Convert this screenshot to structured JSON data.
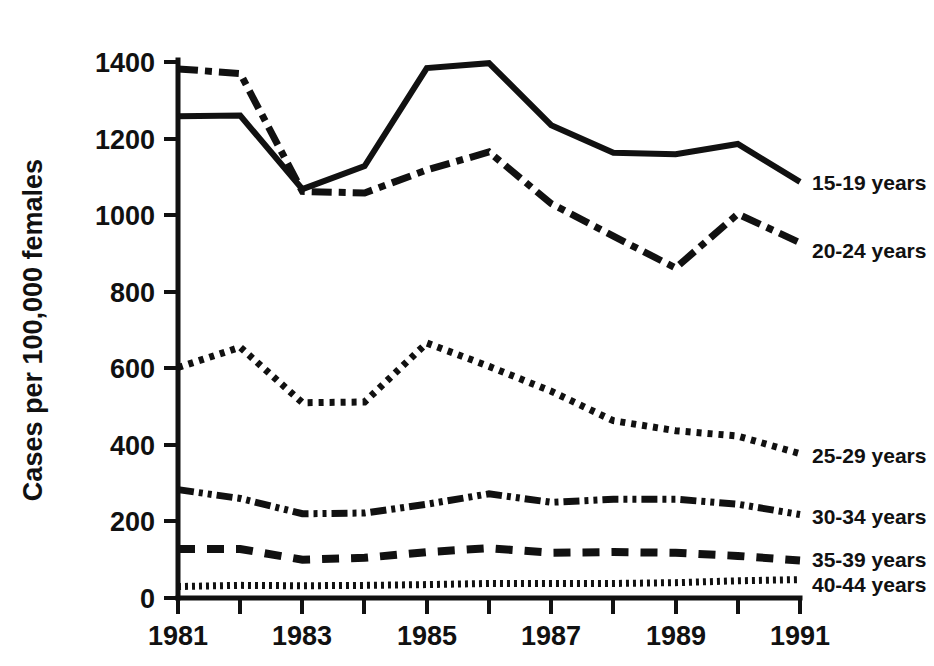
{
  "chart_data": {
    "type": "line",
    "title": "",
    "xlabel": "",
    "ylabel": "Cases per 100,000 females",
    "x": [
      1981,
      1982,
      1983,
      1984,
      1985,
      1986,
      1987,
      1988,
      1989,
      1990,
      1991
    ],
    "xlim": [
      1981,
      1991
    ],
    "ylim": [
      0,
      1400
    ],
    "yticks": [
      0,
      200,
      400,
      600,
      800,
      1000,
      1200,
      1400
    ],
    "ytick_labels": [
      "0",
      "200",
      "400",
      "600",
      "800",
      "1000",
      "1200",
      "1400"
    ],
    "xticks": [
      1981,
      1982,
      1983,
      1984,
      1985,
      1986,
      1987,
      1988,
      1989,
      1990,
      1991
    ],
    "xtick_labels": [
      "1981",
      "",
      "1983",
      "",
      "1985",
      "",
      "1987",
      "",
      "1989",
      "",
      "1991"
    ],
    "xtick_labels_shown": [
      "1981",
      "1983",
      "1985",
      "1987",
      "1989",
      "1991"
    ],
    "grid": false,
    "legend_position": "right-inline",
    "series": [
      {
        "name": "15-19 years",
        "label": "15-19 years",
        "style": "solid",
        "values": [
          1258,
          1260,
          1068,
          1128,
          1384,
          1397,
          1235,
          1163,
          1159,
          1186,
          1087
        ]
      },
      {
        "name": "20-24 years",
        "label": "20-24 years",
        "style": "dash-dot",
        "values": [
          1382,
          1370,
          1062,
          1058,
          1118,
          1165,
          1030,
          945,
          862,
          1003,
          928
        ]
      },
      {
        "name": "25-29 years",
        "label": "25-29 years",
        "style": "dotted",
        "values": [
          602,
          655,
          510,
          512,
          666,
          605,
          540,
          463,
          437,
          423,
          377
        ]
      },
      {
        "name": "30-34 years",
        "label": "30-34 years",
        "style": "dash-dot-dot",
        "values": [
          283,
          260,
          220,
          222,
          245,
          272,
          250,
          258,
          258,
          245,
          218
        ]
      },
      {
        "name": "35-39 years",
        "label": "35-39 years",
        "style": "dashed",
        "values": [
          128,
          128,
          100,
          105,
          120,
          130,
          118,
          120,
          118,
          110,
          98
        ]
      },
      {
        "name": "40-44 years",
        "label": "40-44 years",
        "style": "fine-dotted",
        "values": [
          30,
          33,
          32,
          33,
          35,
          38,
          38,
          38,
          40,
          45,
          48
        ]
      }
    ]
  },
  "axis": {
    "y_title": "Cases per 100,000 females"
  },
  "labels": {
    "s0": "15-19 years",
    "s1": "20-24 years",
    "s2": "25-29 years",
    "s3": "30-34 years",
    "s4": "35-39 years",
    "s5": "40-44 years"
  },
  "yticks": {
    "t0": "0",
    "t1": "200",
    "t2": "400",
    "t3": "600",
    "t4": "800",
    "t5": "1000",
    "t6": "1200",
    "t7": "1400"
  },
  "xticks": {
    "t1981": "1981",
    "t1983": "1983",
    "t1985": "1985",
    "t1987": "1987",
    "t1989": "1989",
    "t1991": "1991"
  },
  "colors": {
    "ink": "#111111",
    "background": "#ffffff"
  }
}
